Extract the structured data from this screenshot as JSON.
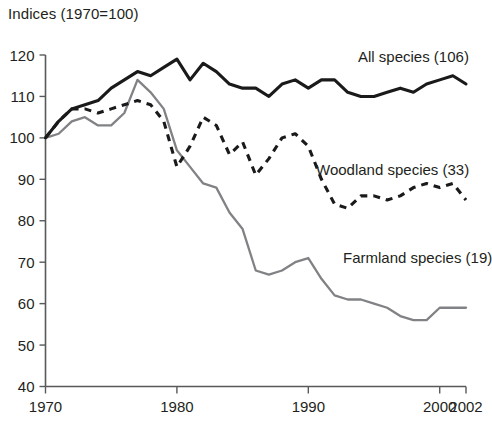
{
  "chart": {
    "axis_title": "Indices (1970=100)"
  },
  "chart_data": {
    "type": "line",
    "title": "Indices (1970=100)",
    "xlabel": "",
    "ylabel": "Indices (1970=100)",
    "xlim": [
      1970,
      2002
    ],
    "ylim": [
      40,
      120
    ],
    "grid": false,
    "legend": "inline-labels",
    "y_ticks": [
      40,
      50,
      60,
      70,
      80,
      90,
      100,
      110,
      120
    ],
    "x_ticks": [
      1970,
      1980,
      1990,
      2000,
      2002
    ],
    "x": [
      1970,
      1971,
      1972,
      1973,
      1974,
      1975,
      1976,
      1977,
      1978,
      1979,
      1980,
      1981,
      1982,
      1983,
      1984,
      1985,
      1986,
      1987,
      1988,
      1989,
      1990,
      1991,
      1992,
      1993,
      1994,
      1995,
      1996,
      1997,
      1998,
      1999,
      2000,
      2001,
      2002
    ],
    "series": [
      {
        "name": "All species (106)",
        "label": "All species (106)",
        "style": "solid",
        "color": "#1a1a1a",
        "values": [
          100,
          104,
          107,
          108,
          109,
          112,
          114,
          116,
          115,
          117,
          119,
          114,
          118,
          116,
          113,
          112,
          112,
          110,
          113,
          114,
          112,
          114,
          114,
          111,
          110,
          110,
          111,
          112,
          111,
          113,
          114,
          115,
          113
        ]
      },
      {
        "name": "Woodland species (33)",
        "label": "Woodland species (33)",
        "style": "dashed",
        "color": "#1a1a1a",
        "values": [
          100,
          104,
          107,
          107,
          106,
          107,
          108,
          109,
          108,
          104,
          93,
          98,
          105,
          103,
          96,
          99,
          91,
          95,
          100,
          101,
          98,
          90,
          84,
          83,
          86,
          86,
          85,
          86,
          88,
          89,
          88,
          89,
          85
        ]
      },
      {
        "name": "Farmland species (19)",
        "label": "Farmland species (19)",
        "style": "solid",
        "color": "#808285",
        "values": [
          100,
          101,
          104,
          105,
          103,
          103,
          106,
          114,
          111,
          107,
          97,
          93,
          89,
          88,
          82,
          78,
          68,
          67,
          68,
          70,
          71,
          66,
          62,
          61,
          61,
          60,
          59,
          57,
          56,
          56,
          59,
          59,
          59
        ]
      }
    ],
    "annotations": [
      {
        "text": "All species (106)",
        "x": 1994,
        "y": 117
      },
      {
        "text": "Woodland species (33)",
        "x": 1992,
        "y": 91
      },
      {
        "text": "Farmland species (19)",
        "x": 1992,
        "y": 73
      }
    ]
  }
}
